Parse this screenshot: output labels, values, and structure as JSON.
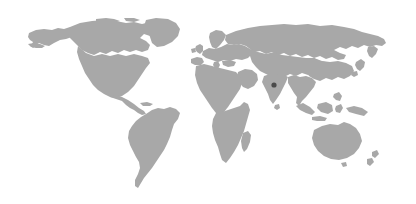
{
  "map": {
    "title": "World Map",
    "type": "world-locator-map",
    "projection": "equirectangular",
    "width": 416,
    "height": 204,
    "background_color": "#ffffff",
    "land_color": "#a8a8a8",
    "land_color_alt": "#adadad",
    "marker_color": "#4a4a4a",
    "border_visible": false,
    "graticule_visible": false,
    "labels_visible": false,
    "legend_visible": false,
    "content_bounds": {
      "left": 28,
      "top": 18,
      "right": 390,
      "bottom": 190
    }
  },
  "markers": [
    {
      "name": "india-location-marker",
      "region": "India",
      "x": 274,
      "y": 85,
      "radius": 2.6,
      "color": "#4a4a4a"
    }
  ],
  "regions": [
    {
      "name": "north-america",
      "label": "North America"
    },
    {
      "name": "greenland",
      "label": "Greenland"
    },
    {
      "name": "south-america",
      "label": "South America"
    },
    {
      "name": "europe",
      "label": "Europe"
    },
    {
      "name": "africa",
      "label": "Africa"
    },
    {
      "name": "asia",
      "label": "Asia"
    },
    {
      "name": "southeast-asia",
      "label": "Southeast Asia"
    },
    {
      "name": "australia",
      "label": "Australia"
    },
    {
      "name": "new-zealand",
      "label": "New Zealand"
    },
    {
      "name": "madagascar",
      "label": "Madagascar"
    },
    {
      "name": "japan",
      "label": "Japan"
    },
    {
      "name": "british-isles",
      "label": "British Isles"
    }
  ]
}
